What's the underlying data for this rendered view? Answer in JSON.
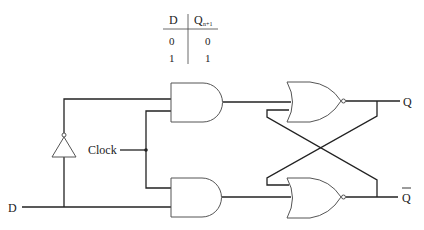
{
  "truth_table": {
    "headers": [
      "D",
      "Q",
      "n+1"
    ],
    "rows": [
      [
        "0",
        "0"
      ],
      [
        "1",
        "1"
      ]
    ]
  },
  "labels": {
    "input_d": "D",
    "clock": "Clock",
    "output_q": "Q",
    "output_qbar": "Q"
  },
  "colors": {
    "stroke": "#222222",
    "gate_outline": "#555555",
    "background": "#ffffff"
  }
}
